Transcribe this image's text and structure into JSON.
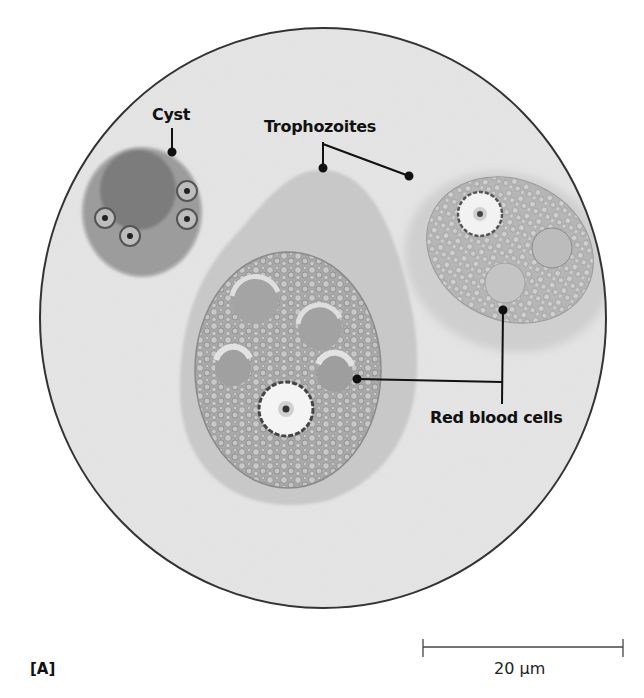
{
  "figure": {
    "panel_label": "[A]",
    "labels": {
      "cyst": "Cyst",
      "trophozoites": "Trophozoites",
      "red_blood_cells": "Red blood cells"
    },
    "scale_bar": {
      "label": "20 µm",
      "value": 20,
      "unit": "µm"
    }
  },
  "colors": {
    "field": "#e8e8e8",
    "outline": "#333333",
    "cyst_body": "#8e8e8e",
    "cyst_dark": "#555555",
    "trophozoite_ecto": "#c4c4c4",
    "trophozoite_endo": "#a8a8a8",
    "nucleus": "#f4f4f4",
    "leader": "#111111"
  }
}
